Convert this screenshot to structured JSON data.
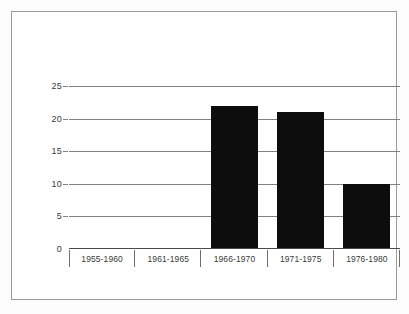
{
  "chart_data": {
    "type": "bar",
    "title": "",
    "subtitle": "",
    "xlabel": "",
    "ylabel": "",
    "categories": [
      "1955-1960",
      "1961-1965",
      "1966-1970",
      "1971-1975",
      "1976-1980"
    ],
    "values": [
      0,
      0,
      22,
      21,
      10
    ],
    "series": [
      {
        "name": "",
        "values": [
          0,
          0,
          22,
          21,
          10
        ]
      }
    ],
    "ylim": [
      0,
      25
    ],
    "yticks": [
      0,
      5,
      10,
      15,
      20,
      25
    ],
    "ytick_labels": [
      "0",
      "5",
      "10",
      "15",
      "20",
      "25"
    ],
    "grid": "horizontal",
    "legend": "none",
    "annotations": [],
    "colors": {
      "bar": "#0d0d0d",
      "gridline": "#808080",
      "axis": "#4a4a4a",
      "frame": "#9a9a9a",
      "text": "#3a3a3a",
      "background": "#ffffff"
    }
  }
}
